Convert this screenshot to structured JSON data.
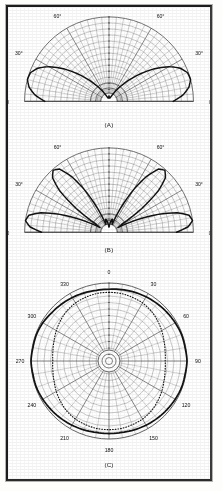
{
  "figure": {
    "background_color": "#ffffff",
    "ink_color": "#111111",
    "grid_color": "#555555",
    "frame_color": "#1c1c1c"
  },
  "panels": [
    {
      "id": "A",
      "caption": "(A)",
      "kind": "half-plane polar radiation pattern",
      "angle_labels": [
        {
          "text": "0",
          "position": "left-baseline"
        },
        {
          "text": "30°",
          "position": "upper-left"
        },
        {
          "text": "60°",
          "position": "upper-left-inner"
        },
        {
          "text": "90°",
          "position": "top-center"
        },
        {
          "text": "60°",
          "position": "upper-right-inner"
        },
        {
          "text": "30°",
          "position": "upper-right"
        },
        {
          "text": "0",
          "position": "right-baseline"
        }
      ]
    },
    {
      "id": "B",
      "caption": "(B)",
      "kind": "half-plane multi-lobe polar radiation pattern",
      "angle_labels": [
        {
          "text": "0",
          "position": "left-baseline"
        },
        {
          "text": "30°",
          "position": "upper-left"
        },
        {
          "text": "60°",
          "position": "upper-left-inner"
        },
        {
          "text": "90°",
          "position": "top-center"
        },
        {
          "text": "60°",
          "position": "upper-right-inner"
        },
        {
          "text": "30°",
          "position": "upper-right"
        },
        {
          "text": "0",
          "position": "right-baseline"
        }
      ]
    },
    {
      "id": "C",
      "caption": "(C)",
      "kind": "full 360 degree polar radiation pattern",
      "angle_labels": [
        {
          "text": "0",
          "position": "top"
        },
        {
          "text": "30",
          "position": "30deg"
        },
        {
          "text": "60",
          "position": "60deg"
        },
        {
          "text": "90",
          "position": "90deg"
        },
        {
          "text": "120",
          "position": "120deg"
        },
        {
          "text": "150",
          "position": "150deg"
        },
        {
          "text": "180",
          "position": "bottom"
        },
        {
          "text": "210",
          "position": "210deg"
        },
        {
          "text": "240",
          "position": "240deg"
        },
        {
          "text": "270",
          "position": "270deg"
        },
        {
          "text": "300",
          "position": "300deg"
        },
        {
          "text": "330",
          "position": "330deg"
        }
      ]
    }
  ],
  "chart_data": [
    {
      "type": "line",
      "subtype": "polar",
      "title": "(A)",
      "xlabel": "Azimuth angle (degrees)",
      "ylabel": "Relative field strength",
      "grid": true,
      "legend": "none",
      "theta_range": [
        0,
        180
      ],
      "theta_ticks": [
        0,
        30,
        60,
        90,
        120,
        150,
        180
      ],
      "theta_tick_labels": [
        "0",
        "30°",
        "60°",
        "90°",
        "60°",
        "30°",
        "0"
      ],
      "r_range": [
        0,
        1
      ],
      "radial_rings": 14,
      "radial_spokes_deg": 5,
      "series": [
        {
          "name": "pattern-A",
          "style": "solid-heavy",
          "theta": [
            0,
            5,
            10,
            15,
            20,
            25,
            30,
            35,
            40,
            45,
            50,
            55,
            60,
            65,
            70,
            75,
            80,
            85,
            90,
            95,
            100,
            105,
            110,
            115,
            120,
            125,
            130,
            135,
            140,
            145,
            150,
            155,
            160,
            165,
            170,
            175,
            180
          ],
          "r": [
            0.76,
            0.88,
            0.96,
            1.0,
            0.99,
            0.93,
            0.82,
            0.68,
            0.53,
            0.39,
            0.27,
            0.18,
            0.11,
            0.07,
            0.05,
            0.04,
            0.04,
            0.05,
            0.06,
            0.05,
            0.04,
            0.04,
            0.05,
            0.07,
            0.11,
            0.18,
            0.27,
            0.39,
            0.53,
            0.68,
            0.82,
            0.93,
            0.99,
            1.0,
            0.96,
            0.88,
            0.76
          ]
        }
      ]
    },
    {
      "type": "line",
      "subtype": "polar",
      "title": "(B)",
      "xlabel": "Azimuth angle (degrees)",
      "ylabel": "Relative field strength",
      "grid": true,
      "legend": "none",
      "theta_range": [
        0,
        180
      ],
      "theta_ticks": [
        0,
        30,
        60,
        90,
        120,
        150,
        180
      ],
      "theta_tick_labels": [
        "0",
        "30°",
        "60°",
        "90°",
        "60°",
        "30°",
        "0"
      ],
      "r_range": [
        0,
        1
      ],
      "radial_rings": 14,
      "radial_spokes_deg": 5,
      "lobe_peaks_deg": [
        12,
        52,
        128,
        168
      ],
      "series": [
        {
          "name": "pattern-B",
          "style": "solid-heavy",
          "theta": [
            0,
            4,
            8,
            12,
            16,
            20,
            24,
            28,
            32,
            36,
            40,
            44,
            48,
            52,
            56,
            60,
            64,
            68,
            72,
            76,
            80,
            84,
            88,
            90,
            92,
            96,
            100,
            104,
            108,
            112,
            116,
            120,
            124,
            128,
            132,
            136,
            140,
            144,
            148,
            152,
            156,
            160,
            164,
            168,
            172,
            176,
            180
          ],
          "r": [
            0.8,
            0.94,
            1.0,
            0.97,
            0.84,
            0.62,
            0.36,
            0.12,
            0.18,
            0.48,
            0.76,
            0.93,
            0.99,
            0.95,
            0.8,
            0.58,
            0.33,
            0.1,
            0.12,
            0.16,
            0.14,
            0.1,
            0.07,
            0.06,
            0.07,
            0.1,
            0.14,
            0.16,
            0.12,
            0.1,
            0.33,
            0.58,
            0.8,
            0.95,
            0.99,
            0.93,
            0.76,
            0.48,
            0.18,
            0.12,
            0.36,
            0.62,
            0.84,
            0.97,
            1.0,
            0.94,
            0.8
          ]
        }
      ]
    },
    {
      "type": "line",
      "subtype": "polar",
      "title": "(C)",
      "xlabel": "Azimuth angle (degrees)",
      "ylabel": "Relative field strength",
      "grid": true,
      "legend": "none",
      "theta_range": [
        0,
        360
      ],
      "theta_ticks": [
        0,
        30,
        60,
        90,
        120,
        150,
        180,
        210,
        240,
        270,
        300,
        330
      ],
      "theta_tick_labels": [
        "0",
        "30",
        "60",
        "90",
        "120",
        "150",
        "180",
        "210",
        "240",
        "270",
        "300",
        "330"
      ],
      "r_range": [
        0,
        1
      ],
      "radial_rings": 12,
      "radial_spokes_deg": 10,
      "series": [
        {
          "name": "measured-outer",
          "style": "solid-heavy",
          "theta": [
            0,
            10,
            20,
            30,
            40,
            50,
            60,
            70,
            80,
            90,
            100,
            110,
            120,
            130,
            140,
            150,
            160,
            170,
            180,
            190,
            200,
            210,
            220,
            230,
            240,
            250,
            260,
            270,
            280,
            290,
            300,
            310,
            320,
            330,
            340,
            350,
            360
          ],
          "r": [
            0.92,
            0.93,
            0.94,
            0.95,
            0.96,
            0.97,
            0.98,
            0.99,
            0.99,
            1.0,
            0.99,
            0.99,
            0.98,
            0.97,
            0.96,
            0.95,
            0.94,
            0.93,
            0.93,
            0.93,
            0.94,
            0.95,
            0.96,
            0.97,
            0.98,
            0.99,
            0.99,
            1.0,
            0.99,
            0.99,
            0.98,
            0.96,
            0.95,
            0.94,
            0.93,
            0.92,
            0.92
          ]
        },
        {
          "name": "theoretical-inner",
          "style": "dotted",
          "theta": [
            0,
            10,
            20,
            30,
            40,
            50,
            60,
            70,
            80,
            90,
            100,
            110,
            120,
            130,
            140,
            150,
            160,
            170,
            180,
            190,
            200,
            210,
            220,
            230,
            240,
            250,
            260,
            270,
            280,
            290,
            300,
            310,
            320,
            330,
            340,
            350,
            360
          ],
          "r": [
            0.88,
            0.88,
            0.87,
            0.86,
            0.84,
            0.81,
            0.78,
            0.75,
            0.73,
            0.72,
            0.73,
            0.75,
            0.78,
            0.81,
            0.84,
            0.86,
            0.87,
            0.88,
            0.88,
            0.88,
            0.87,
            0.86,
            0.84,
            0.81,
            0.78,
            0.75,
            0.73,
            0.72,
            0.73,
            0.75,
            0.78,
            0.81,
            0.84,
            0.86,
            0.87,
            0.88,
            0.88
          ]
        }
      ]
    }
  ]
}
